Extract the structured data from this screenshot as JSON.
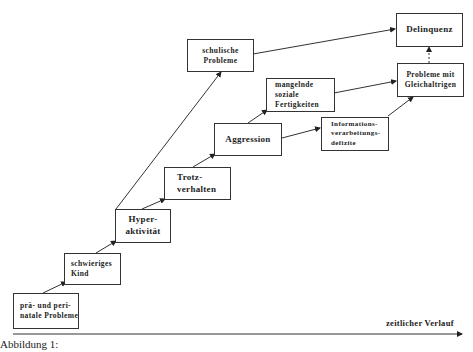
{
  "diagram": {
    "type": "developmental-pathway",
    "nodes": [
      {
        "id": "perinatal",
        "lines": [
          "prä- und peri-",
          "natale Probleme"
        ]
      },
      {
        "id": "schwieriges-kind",
        "lines": [
          "schwieriges",
          "Kind"
        ]
      },
      {
        "id": "hyperaktivitaet",
        "lines": [
          "Hyper-",
          "aktivität"
        ]
      },
      {
        "id": "trotzverhalten",
        "lines": [
          "Trotz-",
          "verhalten"
        ]
      },
      {
        "id": "aggression",
        "lines": [
          "Aggression"
        ]
      },
      {
        "id": "schulische-probleme",
        "lines": [
          "schulische",
          "Probleme"
        ]
      },
      {
        "id": "soziale-fertigkeiten",
        "lines": [
          "mangelnde",
          "soziale",
          "Fertigkeiten"
        ]
      },
      {
        "id": "informationsverarbeitung",
        "lines": [
          "Informations-",
          "verarbeitungs-",
          "defizite"
        ]
      },
      {
        "id": "gleichaltrige",
        "lines": [
          "Probleme mit",
          "Gleichaltrigen"
        ]
      },
      {
        "id": "delinquenz",
        "lines": [
          "Delinquenz"
        ]
      }
    ],
    "edges": [
      {
        "from": "perinatal",
        "to": "schwieriges-kind",
        "style": "solid"
      },
      {
        "from": "schwieriges-kind",
        "to": "hyperaktivitaet",
        "style": "solid"
      },
      {
        "from": "hyperaktivitaet",
        "to": "trotzverhalten",
        "style": "solid"
      },
      {
        "from": "hyperaktivitaet",
        "to": "schulische-probleme",
        "style": "solid"
      },
      {
        "from": "trotzverhalten",
        "to": "aggression",
        "style": "solid"
      },
      {
        "from": "aggression",
        "to": "soziale-fertigkeiten",
        "style": "solid"
      },
      {
        "from": "aggression",
        "to": "informationsverarbeitung",
        "style": "solid"
      },
      {
        "from": "soziale-fertigkeiten",
        "to": "gleichaltrige",
        "style": "solid"
      },
      {
        "from": "informationsverarbeitung",
        "to": "gleichaltrige",
        "style": "solid"
      },
      {
        "from": "schulische-probleme",
        "to": "delinquenz",
        "style": "solid"
      },
      {
        "from": "gleichaltrige",
        "to": "delinquenz",
        "style": "dashed"
      }
    ],
    "timeline_label": "zeitlicher Verlauf",
    "caption": "Abbildung 1:"
  }
}
